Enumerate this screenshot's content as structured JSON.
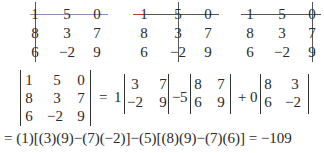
{
  "minor_panels": [
    {
      "label": "cross out row 1, column 1",
      "struck_column": 0,
      "line_color": "#8a8fb8",
      "rows": [
        [
          "1",
          "5",
          "0"
        ],
        [
          "8",
          "3",
          "7"
        ],
        [
          "6",
          "−2",
          "9"
        ]
      ]
    },
    {
      "label": "cross out row 1, column 2",
      "struck_column": 1,
      "line_color": "#555555",
      "line_start_color": "#c0392b",
      "rows": [
        [
          "1",
          "5",
          "0"
        ],
        [
          "8",
          "3",
          "7"
        ],
        [
          "6",
          "−2",
          "9"
        ]
      ]
    },
    {
      "label": "cross out row 1, column 3",
      "struck_column": 2,
      "line_color": "#555555",
      "rows": [
        [
          "1",
          "5",
          "0"
        ],
        [
          "8",
          "3",
          "7"
        ],
        [
          "6",
          "−2",
          "9"
        ]
      ]
    }
  ],
  "expansion": {
    "matrix": [
      [
        "1",
        "5",
        "0"
      ],
      [
        "8",
        "3",
        "7"
      ],
      [
        "6",
        "−2",
        "9"
      ]
    ],
    "equals": "=",
    "terms": [
      {
        "coef": "1",
        "sign": "",
        "minor": [
          [
            "3",
            "7"
          ],
          [
            "−2",
            "9"
          ]
        ]
      },
      {
        "coef": "5",
        "sign": "−",
        "minor": [
          [
            "8",
            "7"
          ],
          [
            "6",
            "9"
          ]
        ]
      },
      {
        "coef": "0",
        "sign": "+",
        "minor": [
          [
            "8",
            "3"
          ],
          [
            "6",
            "−2"
          ]
        ]
      }
    ]
  },
  "final_line": "= (1)[(3)(9)−(7)(−2)]−(5)[(8)(9)−(7)(6)] = −109",
  "result": "−109"
}
